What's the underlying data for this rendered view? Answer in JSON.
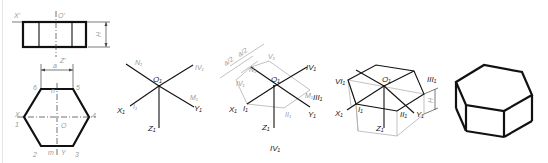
{
  "figure": {
    "panels": [
      {
        "id": "orthographic-views",
        "front_view_labels": {
          "x": "X'",
          "o": "O'",
          "z": "Z'",
          "height": "H",
          "width": "a"
        },
        "top_view_labels": {
          "vertices": [
            "1",
            "2",
            "3",
            "4",
            "5",
            "6"
          ],
          "axis_x": "X",
          "axis_y": "Y",
          "origin": "O",
          "mid_top": "n",
          "mid_bottom": "m"
        }
      },
      {
        "id": "axes-step",
        "labels": {
          "origin": "O₁",
          "x": "X₁",
          "y": "Y₁",
          "z": "Z₁",
          "n": "N₁",
          "m": "M₁",
          "i": "I₁",
          "iv": "IV₁"
        }
      },
      {
        "id": "hexagon-construction-step",
        "labels": {
          "origin": "O₁",
          "x": "X₁",
          "y": "Y₁",
          "z": "Z₁",
          "i": "I₁",
          "ii": "II₁",
          "iii": "III₁",
          "iv": "IV₁",
          "iv_left": "IV₁",
          "v": "V₁",
          "n": "N₁",
          "m": "M₁",
          "dim1": "a/2",
          "dim2": "a/2",
          "caption": "IV₁"
        }
      },
      {
        "id": "prism-height-step",
        "labels": {
          "origin": "O₁",
          "x": "X₁",
          "y": "Y₁",
          "z": "Z₁",
          "i": "I₁",
          "ii": "II₁",
          "iii": "III₁",
          "vi": "VI₁",
          "height": "H"
        }
      },
      {
        "id": "finished-prism",
        "labels": {}
      }
    ]
  }
}
